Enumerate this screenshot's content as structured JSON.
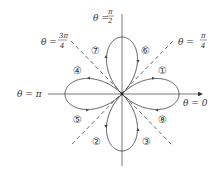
{
  "figure": {
    "axis_labels": {
      "theta_0": "θ = 0",
      "theta_pi": "θ = π",
      "theta_pi_over_2": {
        "prefix": "θ =",
        "num": "π",
        "den": "2"
      },
      "theta_pi_over_4": {
        "prefix": "θ =",
        "num": "π",
        "den": "4"
      },
      "theta_3pi_over_4": {
        "prefix": "θ =",
        "num": "3π",
        "den": "4"
      }
    },
    "region_labels": [
      "①",
      "②",
      "③",
      "④",
      "⑤",
      "⑥",
      "⑦",
      "⑧"
    ],
    "colors": {
      "curve": "#444444",
      "axis": "#555555",
      "dashed": "#444444"
    }
  }
}
